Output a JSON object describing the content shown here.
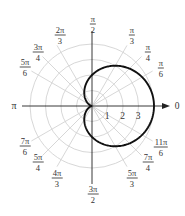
{
  "chart_data": {
    "type": "line",
    "subtype": "polar",
    "title": "",
    "equation_description": "Cardioid r = 2 + 2cos(θ)",
    "series": [
      {
        "name": "r = 2 + 2cos θ",
        "theta": [
          0,
          0.5236,
          0.7854,
          1.0472,
          1.5708,
          2.0944,
          2.3562,
          2.618,
          3.1416,
          3.6652,
          3.927,
          4.1888,
          4.7124,
          5.236,
          5.4978,
          5.7596,
          6.2832
        ],
        "r": [
          4,
          3.73,
          3.41,
          3,
          2,
          1,
          0.59,
          0.27,
          0,
          0.27,
          0.59,
          1,
          2,
          3,
          3.41,
          3.73,
          4
        ],
        "color": "#111111"
      }
    ],
    "radial_ticks": [
      "1",
      "2",
      "3"
    ],
    "radial_range": [
      0,
      4
    ],
    "grid_rings": [
      1,
      2,
      3,
      4
    ],
    "angle_labels": [
      {
        "angle": "0",
        "num": "0",
        "den": ""
      },
      {
        "angle": "π/6",
        "num": "π",
        "den": "6"
      },
      {
        "angle": "π/4",
        "num": "π",
        "den": "4"
      },
      {
        "angle": "π/3",
        "num": "π",
        "den": "3"
      },
      {
        "angle": "π/2",
        "num": "π",
        "den": "2"
      },
      {
        "angle": "2π/3",
        "num": "2π",
        "den": "3"
      },
      {
        "angle": "3π/4",
        "num": "3π",
        "den": "4"
      },
      {
        "angle": "5π/6",
        "num": "5π",
        "den": "6"
      },
      {
        "angle": "π",
        "num": "π",
        "den": ""
      },
      {
        "angle": "7π/6",
        "num": "7π",
        "den": "6"
      },
      {
        "angle": "5π/4",
        "num": "5π",
        "den": "4"
      },
      {
        "angle": "4π/3",
        "num": "4π",
        "den": "3"
      },
      {
        "angle": "3π/2",
        "num": "3π",
        "den": "2"
      },
      {
        "angle": "5π/3",
        "num": "5π",
        "den": "3"
      },
      {
        "angle": "7π/4",
        "num": "7π",
        "den": "4"
      },
      {
        "angle": "11π/6",
        "num": "11π",
        "den": "6"
      }
    ],
    "grid": true,
    "grid_color": "#d0d0d0",
    "axis_color": "#222222"
  },
  "labels": {
    "zero": "0",
    "pi": "π",
    "tick1": "1",
    "tick2": "2",
    "tick3": "3",
    "a_pi_6": {
      "num": "π",
      "den": "6"
    },
    "a_pi_4": {
      "num": "π",
      "den": "4"
    },
    "a_pi_3": {
      "num": "π",
      "den": "3"
    },
    "a_pi_2": {
      "num": "π",
      "den": "2"
    },
    "a_2pi_3": {
      "num": "2π",
      "den": "3"
    },
    "a_3pi_4": {
      "num": "3π",
      "den": "4"
    },
    "a_5pi_6": {
      "num": "5π",
      "den": "6"
    },
    "a_7pi_6": {
      "num": "7π",
      "den": "6"
    },
    "a_5pi_4": {
      "num": "5π",
      "den": "4"
    },
    "a_4pi_3": {
      "num": "4π",
      "den": "3"
    },
    "a_3pi_2": {
      "num": "3π",
      "den": "2"
    },
    "a_5pi_3": {
      "num": "5π",
      "den": "3"
    },
    "a_7pi_4": {
      "num": "7π",
      "den": "4"
    },
    "a_11pi_6": {
      "num": "11π",
      "den": "6"
    }
  }
}
